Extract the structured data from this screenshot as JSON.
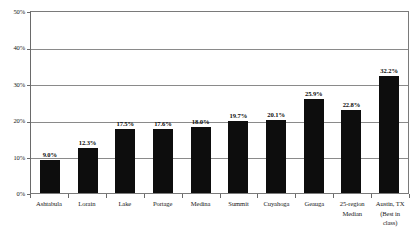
{
  "chart_data": {
    "type": "bar",
    "title": "",
    "subtitle": "",
    "xlabel": "",
    "ylabel": "",
    "ylim": [
      0,
      50
    ],
    "y_unit": "%",
    "grid": true,
    "legend": false,
    "orientation": "vertical",
    "bar_color": "#0d0d0d",
    "background_color": "#ffffff",
    "axis_color": "#7a7a7a",
    "gridline_color": "#8a8a8a",
    "y_ticks": [
      "0%",
      "10%",
      "20%",
      "30%",
      "40%",
      "50%"
    ],
    "y_tick_values": [
      0,
      10,
      20,
      30,
      40,
      50
    ],
    "categories": [
      "Ashtabula",
      "Lorain",
      "Lake",
      "Portage",
      "Medina",
      "Summit",
      "Cuyahoga",
      "Geauga",
      "25-region Median",
      "Austin, TX (Best in class)"
    ],
    "category_lines": [
      [
        "Ashtabula"
      ],
      [
        "Lorain"
      ],
      [
        "Lake"
      ],
      [
        "Portage"
      ],
      [
        "Medina"
      ],
      [
        "Summit"
      ],
      [
        "Cuyahoga"
      ],
      [
        "Geauga"
      ],
      [
        "25-region",
        "Median"
      ],
      [
        "Austin, TX",
        "(Best in",
        "class)"
      ]
    ],
    "values": [
      9.0,
      12.3,
      17.5,
      17.6,
      18.0,
      19.7,
      20.1,
      25.9,
      22.8,
      32.2
    ],
    "data_labels": [
      "9.0%",
      "12.3%",
      "17.5%",
      "17.6%",
      "18.0%",
      "19.7%",
      "20.1%",
      "25.9%",
      "22.8%",
      "32.2%"
    ]
  }
}
